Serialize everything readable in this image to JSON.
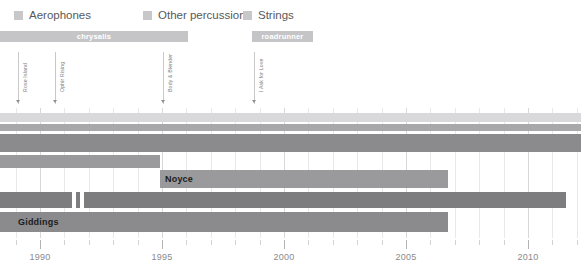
{
  "legend": {
    "items": [
      {
        "label": "Aerophones",
        "color": "#c8c8ca",
        "x": 14,
        "swatch_x": 14,
        "text_x": 27
      },
      {
        "label": "Other percussion",
        "color": "#c8c8ca",
        "x": 143,
        "swatch_x": 143,
        "text_x": 156
      },
      {
        "label": "Strings",
        "color": "#c8c8ca",
        "x": 243,
        "swatch_x": 243,
        "text_x": 256
      }
    ]
  },
  "eras": [
    {
      "name": "chrysalis",
      "start_x": 0,
      "end_x": 188,
      "y": 31,
      "color": "#c5c5c7"
    },
    {
      "name": "roadrunner",
      "start_x": 252,
      "end_x": 313,
      "y": 31,
      "color": "#c5c5c7"
    }
  ],
  "events": [
    {
      "label": "Rose Island",
      "x": 18,
      "label_bottom": 92,
      "line_top": 52,
      "line_bottom": 104
    },
    {
      "label": "Ophir Rising",
      "x": 55,
      "label_bottom": 92,
      "line_top": 52,
      "line_bottom": 104
    },
    {
      "label": "Body & Blender",
      "x": 163,
      "label_bottom": 92,
      "line_top": 52,
      "line_bottom": 104
    },
    {
      "label": "I Ask for Love",
      "x": 254,
      "label_bottom": 92,
      "line_top": 52,
      "line_bottom": 104
    }
  ],
  "chart_data": {
    "type": "bar",
    "orientation": "horizontal-timeline",
    "title": "",
    "xlabel": "",
    "ylabel": "",
    "xlim": [
      1988.4,
      2012.2
    ],
    "grid": true,
    "legend_position": "top-left",
    "legend_entries": [
      "Aerophones",
      "Other percussion",
      "Strings"
    ],
    "axis": {
      "major_ticks": [
        1990,
        1995,
        2000,
        2005,
        2010
      ],
      "major_tick_labels": [
        "1990",
        "1995",
        "2000",
        "2005",
        "2010"
      ],
      "minor_tick_interval": 1,
      "tick_px": [
        40,
        162,
        284,
        406,
        528
      ],
      "px_per_year": 24.4,
      "origin_year": 1990,
      "origin_px": 40
    },
    "tracks": [
      {
        "name": "track-1",
        "label": "",
        "y": 113,
        "height": 9,
        "color": "#d9d9db",
        "segments": [
          {
            "start_x": 0,
            "end_x": 581,
            "start_year": 1988.4,
            "end_year": 2012.2
          }
        ]
      },
      {
        "name": "track-2",
        "label": "",
        "y": 124,
        "height": 7,
        "color": "#a8a8aa",
        "segments": [
          {
            "start_x": 0,
            "end_x": 581,
            "start_year": 1988.4,
            "end_year": 2012.2
          }
        ]
      },
      {
        "name": "track-3",
        "label": "",
        "y": 134,
        "height": 18,
        "color": "#8b8b8d",
        "segments": [
          {
            "start_x": 0,
            "end_x": 581,
            "start_year": 1988.4,
            "end_year": 2012.2
          }
        ]
      },
      {
        "name": "track-4",
        "label": "",
        "y": 155,
        "height": 13,
        "color": "#9a9a9c",
        "segments": [
          {
            "start_x": 0,
            "end_x": 160,
            "start_year": 1988.4,
            "end_year": 1994.9
          }
        ]
      },
      {
        "name": "track-noyce",
        "label": "Noyce",
        "label_x": 165,
        "y": 170,
        "height": 18,
        "color": "#9a9a9c",
        "segments": [
          {
            "start_x": 160,
            "end_x": 448,
            "start_year": 1994.9,
            "end_year": 2006.7
          }
        ]
      },
      {
        "name": "track-6",
        "label": "",
        "y": 192,
        "height": 16,
        "color": "#7d7d7f",
        "segments": [
          {
            "start_x": 0,
            "end_x": 72,
            "start_year": 1988.4,
            "end_year": 1991.3
          },
          {
            "start_x": 76,
            "end_x": 80,
            "start_year": 1991.5,
            "end_year": 1991.6
          },
          {
            "start_x": 84,
            "end_x": 566,
            "start_year": 1991.8,
            "end_year": 2011.6
          }
        ]
      },
      {
        "name": "track-giddings",
        "label": "Giddings",
        "label_x": 18,
        "y": 212,
        "height": 20,
        "color": "#8b8b8d",
        "segments": [
          {
            "start_x": 0,
            "end_x": 448,
            "start_year": 1988.4,
            "end_year": 2006.7
          }
        ]
      }
    ]
  }
}
